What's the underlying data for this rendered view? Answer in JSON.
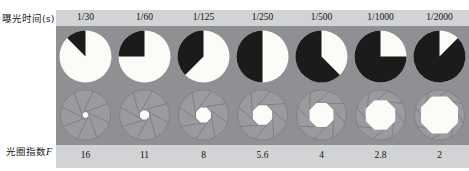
{
  "figure": {
    "row_labels": {
      "exposure": "曝光时间(s)",
      "aperture_prefix": "光圈指数",
      "aperture_symbol": "F"
    },
    "panel_background": "#8f9094",
    "band_background": "#d2d3d5",
    "pie_dark_color": "#1b1b1b",
    "pie_light_color": "#fbfbf7",
    "iris_blade_color": "#9a9b9e",
    "iris_opening_color": "#fbfbf7"
  },
  "chart_data": {
    "type": "pie",
    "xlabel": "",
    "ylabel": "",
    "legend": [],
    "grid": false,
    "categories": [
      "1/30",
      "1/60",
      "1/125",
      "1/250",
      "1/500",
      "1/1000",
      "1/2000"
    ],
    "series": [
      {
        "name": "exposure_time_label",
        "values": [
          "1/30",
          "1/60",
          "1/125",
          "1/250",
          "1/500",
          "1/1000",
          "1/2000"
        ]
      },
      {
        "name": "aperture_f_number",
        "values": [
          "16",
          "11",
          "8",
          "5.6",
          "4",
          "2.8",
          "2"
        ]
      },
      {
        "name": "pie_light_fraction_percent",
        "values": [
          87.5,
          75,
          62.5,
          50,
          37.5,
          25,
          12.5
        ]
      },
      {
        "name": "pie_dark_fraction_percent",
        "values": [
          12.5,
          25,
          37.5,
          50,
          62.5,
          75,
          87.5
        ]
      },
      {
        "name": "iris_opening_radius_px",
        "values": [
          3,
          5,
          8,
          10.5,
          13,
          16,
          20
        ]
      }
    ],
    "columns": [
      {
        "exposure": "1/30",
        "f": "16",
        "light_pct": 87.5,
        "dark_pct": 12.5,
        "iris_r": 3
      },
      {
        "exposure": "1/60",
        "f": "11",
        "light_pct": 75,
        "dark_pct": 25,
        "iris_r": 5
      },
      {
        "exposure": "1/125",
        "f": "8",
        "light_pct": 62.5,
        "dark_pct": 37.5,
        "iris_r": 8
      },
      {
        "exposure": "1/250",
        "f": "5.6",
        "light_pct": 50,
        "dark_pct": 50,
        "iris_r": 10.5
      },
      {
        "exposure": "1/500",
        "f": "4",
        "light_pct": 37.5,
        "dark_pct": 62.5,
        "iris_r": 13
      },
      {
        "exposure": "1/1000",
        "f": "2.8",
        "light_pct": 25,
        "dark_pct": 75,
        "iris_r": 16
      },
      {
        "exposure": "1/2000",
        "f": "2",
        "light_pct": 12.5,
        "dark_pct": 87.5,
        "iris_r": 20
      }
    ]
  }
}
